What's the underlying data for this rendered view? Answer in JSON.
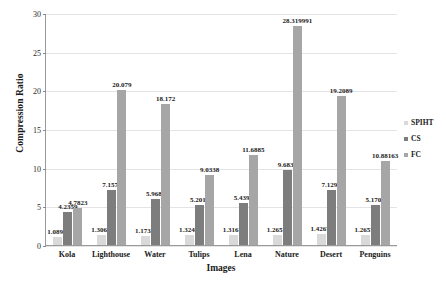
{
  "chart_data": {
    "type": "bar",
    "title": "",
    "xlabel": "Images",
    "ylabel": "Compression Ratio",
    "ylim": [
      0,
      30
    ],
    "yticks": [
      0,
      5,
      10,
      15,
      20,
      25,
      30
    ],
    "grid": true,
    "legend_position": "right",
    "categories": [
      "Kola",
      "Lighthouse",
      "Water",
      "Tulips",
      "Lena",
      "Nature",
      "Desert",
      "Penguins"
    ],
    "series": [
      {
        "name": "SPIHT",
        "color": "#d9d9d9",
        "values": [
          1.0898,
          1.3066,
          1.1733,
          1.3246,
          1.3161,
          1.2657,
          1.4267,
          1.2657
        ],
        "labels": [
          "1.0898",
          "1.3066",
          "1.1733",
          "1.3246",
          "1.3161",
          "1.2657",
          "1.4267",
          "1.2657"
        ]
      },
      {
        "name": "CS",
        "color": "#7d7d7d",
        "values": [
          4.2359,
          7.1577,
          5.9687,
          5.2013,
          5.4396,
          9.6832,
          7.1297,
          5.1701
        ],
        "labels": [
          "4.2359",
          "7.1577",
          "5.9687",
          "5.2013",
          "5.4396",
          "9.6832",
          "7.1297",
          "5.1701"
        ]
      },
      {
        "name": "FC",
        "color": "#a6a6a6",
        "values": [
          4.7823,
          20.079,
          18.172,
          9.0338,
          11.6885,
          28.319991,
          19.2089,
          10.88163
        ],
        "labels": [
          "4.7823",
          "20.079",
          "18.172",
          "9.0338",
          "11.6885",
          "28.319991",
          "19.2089",
          "10.88163"
        ]
      }
    ]
  }
}
